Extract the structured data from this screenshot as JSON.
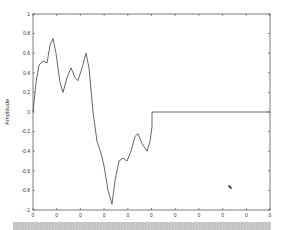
{
  "chart_data": {
    "type": "line",
    "title": "",
    "xlabel": "",
    "ylabel": "Amplitude",
    "ylim": [
      -1,
      1
    ],
    "yticks": [
      "-1",
      "-0.8",
      "-0.6",
      "-0.4",
      "-0.2",
      "0",
      "0.2",
      "0.4",
      "0.6",
      "0.8",
      "1"
    ],
    "xticks": [
      "0",
      "0",
      "0",
      "0",
      "0",
      "0",
      "0",
      "0",
      "0",
      "0",
      "0"
    ],
    "grid": false,
    "legend": null,
    "series": [
      {
        "name": "signal",
        "x_px": [
          33,
          36,
          39,
          43,
          47,
          50,
          53,
          56,
          60,
          63,
          67,
          71,
          75,
          78,
          82,
          86,
          89,
          93,
          97,
          101,
          104,
          108,
          112,
          115,
          119,
          123,
          127,
          131,
          135,
          138,
          142,
          147,
          150,
          152,
          152,
          270
        ],
        "values": [
          0.0,
          0.3,
          0.48,
          0.52,
          0.5,
          0.68,
          0.75,
          0.6,
          0.3,
          0.2,
          0.35,
          0.45,
          0.35,
          0.32,
          0.45,
          0.6,
          0.45,
          0.0,
          -0.3,
          -0.42,
          -0.55,
          -0.8,
          -0.94,
          -0.7,
          -0.5,
          -0.47,
          -0.5,
          -0.4,
          -0.25,
          -0.22,
          -0.32,
          -0.4,
          -0.3,
          -0.15,
          0.0,
          0.0
        ]
      }
    ],
    "annotations": [
      {
        "type": "marker",
        "x_px": 230,
        "y_px": 187
      }
    ]
  }
}
